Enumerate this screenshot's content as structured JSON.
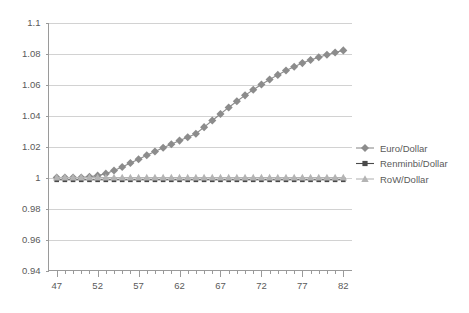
{
  "chart_data": {
    "type": "line",
    "title": "",
    "subtitle": "",
    "xlabel": "",
    "ylabel": "",
    "xlim": [
      46,
      83
    ],
    "ylim": [
      0.94,
      1.1
    ],
    "grid": true,
    "legend_position": "right",
    "y_ticks": [
      "0.94",
      "0.96",
      "0.98",
      "1",
      "1.02",
      "1.04",
      "1.06",
      "1.08",
      "1.1"
    ],
    "y_tick_values": [
      0.94,
      0.96,
      0.98,
      1.0,
      1.02,
      1.04,
      1.06,
      1.08,
      1.1
    ],
    "x_ticks": [
      "47",
      "52",
      "57",
      "62",
      "67",
      "72",
      "77",
      "82"
    ],
    "x_tick_values": [
      47,
      52,
      57,
      62,
      67,
      72,
      77,
      82
    ],
    "x_minor_step": 1,
    "x": [
      47,
      48,
      49,
      50,
      51,
      52,
      53,
      54,
      55,
      56,
      57,
      58,
      59,
      60,
      61,
      62,
      63,
      64,
      65,
      66,
      67,
      68,
      69,
      70,
      71,
      72,
      73,
      74,
      75,
      76,
      77,
      78,
      79,
      80,
      81,
      82
    ],
    "series": [
      {
        "name": "Euro/Dollar",
        "marker": "diamond",
        "color": "#8c8c8c",
        "values": [
          1.0,
          1.0,
          1.0,
          1.0,
          1.0005,
          1.0012,
          1.0025,
          1.0045,
          1.0068,
          1.0093,
          1.0118,
          1.0143,
          1.0168,
          1.0192,
          1.0215,
          1.0238,
          1.026,
          1.0282,
          1.0325,
          1.0368,
          1.041,
          1.0452,
          1.0492,
          1.053,
          1.0566,
          1.06,
          1.0632,
          1.0662,
          1.069,
          1.0715,
          1.0738,
          1.0758,
          1.0776,
          1.0792,
          1.0807,
          1.082
        ]
      },
      {
        "name": "Renminbi/Dollar",
        "marker": "square",
        "color": "#4a4a4a",
        "values": [
          0.9985,
          0.9985,
          0.9985,
          0.9985,
          0.9985,
          0.9985,
          0.9985,
          0.9985,
          0.9985,
          0.9985,
          0.9985,
          0.9985,
          0.9985,
          0.9985,
          0.9985,
          0.9985,
          0.9985,
          0.9985,
          0.9985,
          0.9985,
          0.9985,
          0.9985,
          0.9985,
          0.9985,
          0.9985,
          0.9985,
          0.9985,
          0.9985,
          0.9985,
          0.9985,
          0.9985,
          0.9985,
          0.9985,
          0.9985,
          0.9985,
          0.9985
        ]
      },
      {
        "name": "RoW/Dollar",
        "marker": "triangle",
        "color": "#b4b4b4",
        "values": [
          1.0,
          1.0,
          1.0,
          1.0,
          1.0,
          1.0,
          1.0,
          1.0,
          1.0,
          1.0,
          1.0,
          1.0,
          1.0,
          1.0,
          1.0,
          1.0,
          1.0,
          1.0,
          1.0,
          1.0,
          1.0,
          1.0,
          1.0,
          1.0,
          1.0,
          1.0,
          1.0,
          1.0,
          1.0,
          1.0,
          1.0,
          1.0,
          1.0,
          1.0,
          1.0,
          1.0
        ]
      }
    ]
  },
  "legend": {
    "items": [
      {
        "label": "Euro/Dollar",
        "marker": "diamond",
        "color": "#8c8c8c"
      },
      {
        "label": "Renminbi/Dollar",
        "marker": "square",
        "color": "#4a4a4a"
      },
      {
        "label": "RoW/Dollar",
        "marker": "triangle",
        "color": "#b4b4b4"
      }
    ]
  }
}
